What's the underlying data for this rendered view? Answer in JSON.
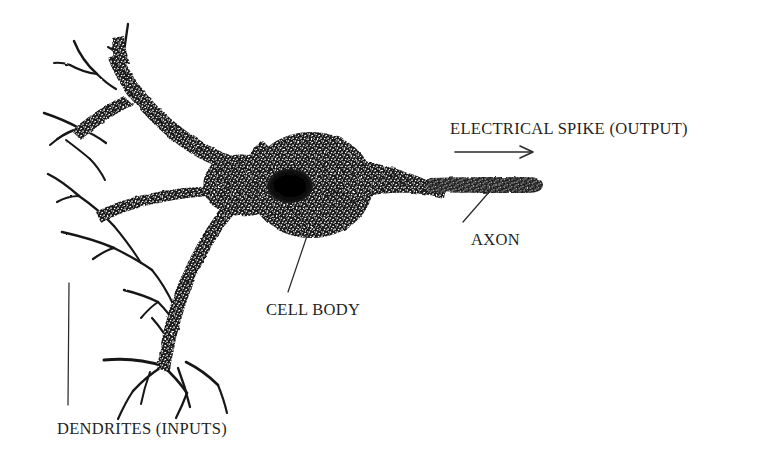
{
  "figure": {
    "background_color": "#ffffff",
    "ink_color": "#171717",
    "width": 782,
    "height": 456
  },
  "labels": {
    "output": "ELECTRICAL SPIKE (OUTPUT)",
    "axon": "AXON",
    "cell_body": "CELL BODY",
    "dendrites": "DENDRITES (INPUTS)"
  },
  "parts": [
    {
      "name": "dendrites",
      "label": "DENDRITES (INPUTS)",
      "role": "inputs"
    },
    {
      "name": "cell-body",
      "label": "CELL BODY",
      "role": "soma"
    },
    {
      "name": "axon",
      "label": "AXON",
      "role": "output-fiber"
    },
    {
      "name": "electrical-spike",
      "label": "ELECTRICAL SPIKE (OUTPUT)",
      "role": "signal-direction"
    }
  ],
  "annotations": {
    "spike_arrow_direction": "right",
    "signal_flow": "dendrites -> cell body -> axon -> electrical spike"
  }
}
